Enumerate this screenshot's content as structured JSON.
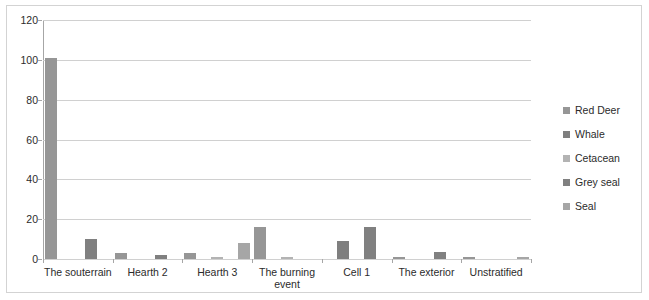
{
  "chart_data": {
    "type": "bar",
    "title": "",
    "xlabel": "",
    "ylabel": "",
    "ylim": [
      0,
      120
    ],
    "ytick_values": [
      0,
      20,
      40,
      60,
      80,
      100,
      120
    ],
    "ytick_labels": [
      "0",
      "20",
      "40",
      "60",
      "80",
      "100",
      "120"
    ],
    "grid": true,
    "legend_position": "right",
    "categories": [
      "The souterrain",
      "Hearth 2",
      "Hearth 3",
      "The burning event",
      "Cell 1",
      "The exterior",
      "Unstratified"
    ],
    "series": [
      {
        "name": "Red Deer",
        "color": "#969696",
        "values": [
          101,
          3,
          3,
          16,
          0,
          1,
          1
        ]
      },
      {
        "name": "Whale",
        "color": "#7f7f7f",
        "values": [
          0,
          0,
          0,
          0,
          9,
          0,
          0
        ]
      },
      {
        "name": "Cetacean",
        "color": "#b3b3b3",
        "values": [
          0,
          0,
          1,
          1,
          0,
          0,
          0
        ]
      },
      {
        "name": "Grey seal",
        "color": "#808080",
        "values": [
          10,
          2,
          0,
          0,
          16,
          3.5,
          0
        ]
      },
      {
        "name": "Seal",
        "color": "#a6a6a6",
        "values": [
          0,
          0,
          8,
          0,
          0,
          0,
          1
        ]
      }
    ]
  },
  "legend": {
    "items": [
      {
        "label": "Red Deer",
        "color": "#969696"
      },
      {
        "label": "Whale",
        "color": "#7f7f7f"
      },
      {
        "label": "Cetacean",
        "color": "#b3b3b3"
      },
      {
        "label": "Grey seal",
        "color": "#808080"
      },
      {
        "label": "Seal",
        "color": "#a6a6a6"
      }
    ]
  }
}
